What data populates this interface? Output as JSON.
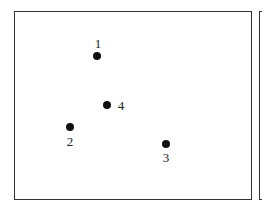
{
  "diagram": {
    "frames": [
      {
        "name": "main-frame",
        "left": 14,
        "top": 11,
        "width": 238,
        "height": 189
      },
      {
        "name": "partial-frame-right",
        "left": 259,
        "top": 11,
        "width": 20,
        "height": 189
      }
    ],
    "points": [
      {
        "label": "1",
        "x": 97,
        "y": 56,
        "label_x": 98,
        "label_y": 43
      },
      {
        "label": "2",
        "x": 70,
        "y": 127,
        "label_x": 70,
        "label_y": 141
      },
      {
        "label": "3",
        "x": 166,
        "y": 144,
        "label_x": 166,
        "label_y": 157
      },
      {
        "label": "4",
        "x": 107,
        "y": 105,
        "label_x": 121,
        "label_y": 105
      }
    ]
  }
}
